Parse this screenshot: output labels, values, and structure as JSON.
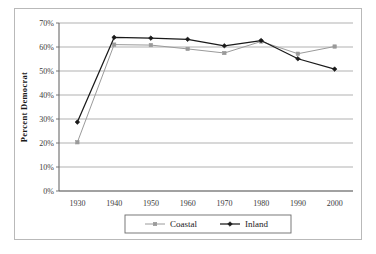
{
  "chart_data": {
    "type": "line",
    "title": "",
    "xlabel": "",
    "ylabel": "Percent Democrat",
    "categories": [
      "1930",
      "1940",
      "1950",
      "1960",
      "1970",
      "1980",
      "1990",
      "2000"
    ],
    "x": [
      1930,
      1940,
      1950,
      1960,
      1970,
      1980,
      1990,
      2000
    ],
    "ylim": [
      0,
      70
    ],
    "xlim": [
      1925,
      2005
    ],
    "ytick_labels": [
      "0%",
      "10%",
      "20%",
      "30%",
      "40%",
      "50%",
      "60%",
      "70%"
    ],
    "ytick_values": [
      0,
      10,
      20,
      30,
      40,
      50,
      60,
      70
    ],
    "xtick_labels": [
      "1930",
      "1940",
      "1950",
      "1960",
      "1970",
      "1980",
      "1990",
      "2000"
    ],
    "grid": "horizontal",
    "legend_position": "bottom",
    "series": [
      {
        "name": "Coastal",
        "color": "#9a9a9a",
        "marker": "square",
        "values": [
          20.3,
          61.0,
          60.8,
          59.2,
          57.5,
          62.3,
          57.2,
          60.2
        ]
      },
      {
        "name": "Inland",
        "color": "#1a1a1a",
        "marker": "diamond",
        "values": [
          28.7,
          64.0,
          63.7,
          63.2,
          60.5,
          62.7,
          55.1,
          50.8
        ]
      }
    ]
  },
  "legend": {
    "items": [
      {
        "label": "Coastal"
      },
      {
        "label": "Inland"
      }
    ]
  },
  "colors": {
    "coastal": "#9a9a9a",
    "inland": "#1a1a1a",
    "grid": "#a8a8a8",
    "axis": "#6a6a6a",
    "frame": "#b9b9b9"
  }
}
